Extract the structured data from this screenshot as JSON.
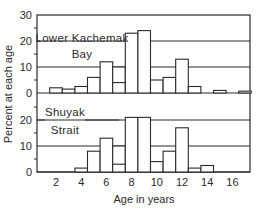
{
  "chart_data": {
    "type": "bar",
    "xlabel": "Age in years",
    "ylabel": "Percent at each age",
    "x_ticks": [
      "2",
      "4",
      "6",
      "8",
      "10",
      "12",
      "14",
      "16"
    ],
    "y_ticks": [
      "0",
      "10",
      "20",
      "30"
    ],
    "ylim": [
      0,
      30
    ],
    "xlim": [
      0.5,
      17.5
    ],
    "grid": "horizontal at 10 and 20",
    "panels": [
      {
        "name": "Lower Kachemak Bay",
        "label_line1": "Lower Kachemak",
        "label_line2": "Bay",
        "ages": [
          2,
          3,
          4,
          5,
          6,
          7,
          8,
          9,
          10,
          11,
          12,
          13,
          15,
          17
        ],
        "values": [
          2,
          1.5,
          2.5,
          6,
          12,
          10,
          23,
          24,
          5,
          6,
          13,
          2.5,
          1,
          0.7
        ],
        "inner_marks": [
          {
            "age": 7,
            "value": 4
          }
        ]
      },
      {
        "name": "Shuyak Strait",
        "label_line1": "Shuyak",
        "label_line2": "Strait",
        "ages": [
          4,
          5,
          6,
          7,
          8,
          9,
          10,
          11,
          12,
          13,
          14
        ],
        "values": [
          1.5,
          8,
          13,
          10,
          21,
          21,
          4,
          8,
          17,
          1.5,
          2.5
        ],
        "inner_marks": [
          {
            "age": 7,
            "value": 3
          }
        ]
      }
    ]
  },
  "colors": {
    "ink": "#2a2a2a",
    "background": "#ffffff"
  }
}
